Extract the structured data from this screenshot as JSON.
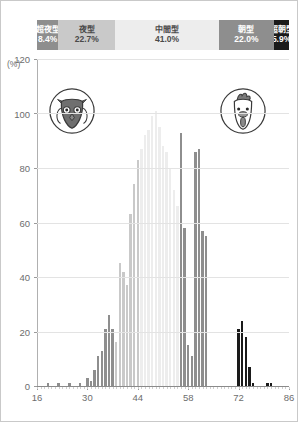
{
  "band": {
    "segments": [
      {
        "label": "超夜型",
        "value": "8.4%",
        "pct": 8.4,
        "bg": "#8e8e8e",
        "fg": "#ffffff"
      },
      {
        "label": "夜型",
        "value": "22.7%",
        "pct": 22.7,
        "bg": "#c9c9c9",
        "fg": "#4a4a4a"
      },
      {
        "label": "中間型",
        "value": "41.0%",
        "pct": 41.0,
        "bg": "#ededed",
        "fg": "#4a4a4a"
      },
      {
        "label": "朝型",
        "value": "22.0%",
        "pct": 22.0,
        "bg": "#8e8e8e",
        "fg": "#ffffff"
      },
      {
        "label": "超朝型",
        "value": "5.9%",
        "pct": 5.9,
        "bg": "#1a1a1a",
        "fg": "#ffffff"
      }
    ]
  },
  "axis": {
    "unit_label": "(%)",
    "y_ticks": [
      0,
      20,
      40,
      60,
      80,
      100,
      120
    ],
    "x_ticks": [
      16,
      30,
      44,
      58,
      72,
      86
    ]
  },
  "icons": {
    "left": {
      "name": "owl-face-icon",
      "title": "超夜型"
    },
    "right": {
      "name": "rooster-face-icon",
      "title": "超朝型"
    }
  },
  "chart_data": {
    "type": "bar",
    "title": "",
    "xlabel": "",
    "ylabel": "(%)",
    "xlim": [
      16,
      86
    ],
    "ylim": [
      0,
      120
    ],
    "grid": true,
    "legend": "none",
    "bin_width": 1,
    "colors": {
      "super_evening": "#8e8e8e",
      "evening": "#c9c9c9",
      "intermediate": "#ededed",
      "morning": "#8e8e8e",
      "super_morning": "#1a1a1a"
    },
    "x": [
      16,
      17,
      18,
      19,
      20,
      21,
      22,
      23,
      24,
      25,
      26,
      27,
      28,
      29,
      30,
      31,
      32,
      33,
      34,
      35,
      36,
      37,
      38,
      39,
      40,
      41,
      42,
      43,
      44,
      45,
      46,
      47,
      48,
      49,
      50,
      51,
      52,
      53,
      54,
      55,
      56,
      57,
      58,
      59,
      60,
      61,
      62,
      63,
      64,
      65,
      66,
      67,
      68,
      69,
      70,
      71,
      72,
      73,
      74,
      75,
      76,
      77,
      78,
      79,
      80,
      81,
      82,
      83,
      84,
      85,
      86
    ],
    "values": [
      0,
      0,
      0,
      1,
      0,
      0,
      1,
      0,
      0,
      1,
      0,
      0,
      1,
      0,
      3,
      2,
      6,
      11,
      13,
      21,
      26,
      21,
      16,
      45,
      42,
      37,
      63,
      74,
      83,
      87,
      92,
      94,
      99,
      101,
      95,
      88,
      86,
      80,
      72,
      66,
      93,
      58,
      15,
      11,
      86,
      87,
      57,
      55,
      0,
      0,
      0,
      0,
      0,
      0,
      0,
      0,
      21,
      24,
      18,
      7,
      1,
      0,
      0,
      0,
      1,
      1,
      0,
      0,
      0,
      0,
      0
    ],
    "series_colors": [
      "#8e8e8e",
      "#8e8e8e",
      "#8e8e8e",
      "#8e8e8e",
      "#8e8e8e",
      "#8e8e8e",
      "#8e8e8e",
      "#8e8e8e",
      "#8e8e8e",
      "#8e8e8e",
      "#8e8e8e",
      "#8e8e8e",
      "#8e8e8e",
      "#8e8e8e",
      "#8e8e8e",
      "#8e8e8e",
      "#8e8e8e",
      "#8e8e8e",
      "#8e8e8e",
      "#8e8e8e",
      "#8e8e8e",
      "#8e8e8e",
      "#c9c9c9",
      "#c9c9c9",
      "#c9c9c9",
      "#c9c9c9",
      "#c9c9c9",
      "#c9c9c9",
      "#c9c9c9",
      "#ededed",
      "#ededed",
      "#ededed",
      "#ededed",
      "#ededed",
      "#ededed",
      "#ededed",
      "#ededed",
      "#ededed",
      "#ededed",
      "#ededed",
      "#8e8e8e",
      "#8e8e8e",
      "#8e8e8e",
      "#8e8e8e",
      "#8e8e8e",
      "#8e8e8e",
      "#8e8e8e",
      "#8e8e8e",
      "#8e8e8e",
      "#8e8e8e",
      "#8e8e8e",
      "#8e8e8e",
      "#8e8e8e",
      "#8e8e8e",
      "#8e8e8e",
      "#8e8e8e",
      "#1a1a1a",
      "#1a1a1a",
      "#1a1a1a",
      "#1a1a1a",
      "#1a1a1a",
      "#1a1a1a",
      "#1a1a1a",
      "#1a1a1a",
      "#1a1a1a",
      "#1a1a1a",
      "#1a1a1a",
      "#1a1a1a",
      "#1a1a1a",
      "#1a1a1a",
      "#1a1a1a"
    ]
  }
}
